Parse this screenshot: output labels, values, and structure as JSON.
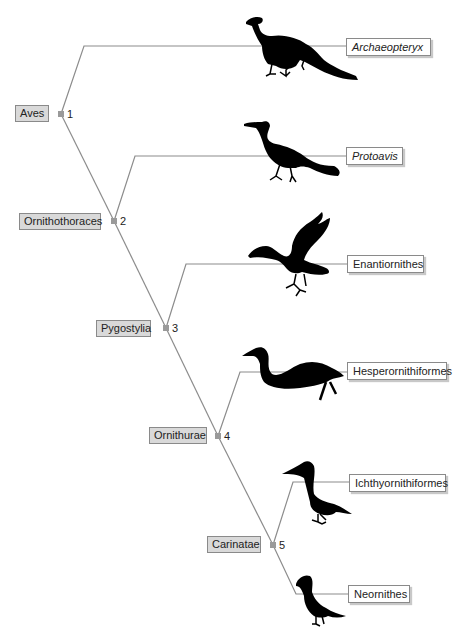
{
  "diagram": {
    "type": "cladogram",
    "colors": {
      "branch": "#8c8c8c",
      "node_marker": "#9a9a9a",
      "clade_label_bg": "#d9d9d9",
      "taxon_label_bg": "#ffffff",
      "silhouette": "#000000"
    },
    "nodes": [
      {
        "number": "1",
        "clade": "Aves"
      },
      {
        "number": "2",
        "clade": "Ornithothoraces"
      },
      {
        "number": "3",
        "clade": "Pygostylia"
      },
      {
        "number": "4",
        "clade": "Ornithurae"
      },
      {
        "number": "5",
        "clade": "Carinatae"
      }
    ],
    "taxa": [
      {
        "name": "Archaeopteryx",
        "italic": true,
        "icon": "archaeopteryx-silhouette"
      },
      {
        "name": "Protoavis",
        "italic": true,
        "icon": "protoavis-silhouette"
      },
      {
        "name": "Enantiornithes",
        "italic": false,
        "icon": "enantiornithine-silhouette"
      },
      {
        "name": "Hesperornithiformes",
        "italic": false,
        "icon": "hesperornis-silhouette"
      },
      {
        "name": "Ichthyornithiformes",
        "italic": false,
        "icon": "ichthyornis-silhouette"
      },
      {
        "name": "Neornithes",
        "italic": false,
        "icon": "neornithine-silhouette"
      }
    ],
    "topology": "(Archaeopteryx,(Protoavis,(Enantiornithes,(Hesperornithiformes,(Ichthyornithiformes,Neornithes)5)4)3)2)1"
  }
}
